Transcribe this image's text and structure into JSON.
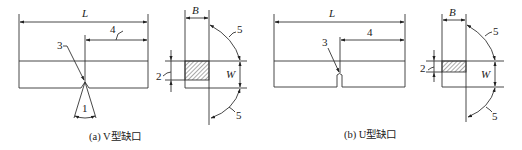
{
  "figures": [
    {
      "id": "a",
      "caption": "(a) V型缺口",
      "notch_type": "V",
      "labels": {
        "length": "L",
        "thickness": "B",
        "width": "W",
        "callout_angle": "1",
        "callout_depth": "2",
        "callout_notch": "3",
        "callout_offset": "4",
        "callout_squareness_top": "5",
        "callout_squareness_bottom": "5"
      }
    },
    {
      "id": "b",
      "caption": "(b) U型缺口",
      "notch_type": "U",
      "labels": {
        "length": "L",
        "thickness": "B",
        "width": "W",
        "callout_depth": "2",
        "callout_notch": "3",
        "callout_offset": "4",
        "callout_squareness_top": "5",
        "callout_squareness_bottom": "5"
      }
    }
  ],
  "colors": {
    "line": "#333333",
    "hatch": "#555555",
    "background": "#ffffff"
  }
}
